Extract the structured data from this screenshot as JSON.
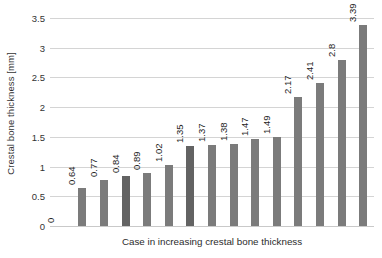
{
  "chart_data": {
    "type": "bar",
    "title": "",
    "xlabel": "Case in increasing crestal bone thickness",
    "ylabel": "Crestal bone thickness [mm]",
    "categories": [
      "1",
      "2",
      "3",
      "4",
      "5",
      "6",
      "7",
      "8",
      "9",
      "10",
      "11",
      "12",
      "13",
      "14",
      "15"
    ],
    "values": [
      0,
      0.64,
      0.77,
      0.84,
      0.89,
      1.02,
      1.35,
      1.37,
      1.38,
      1.47,
      1.49,
      2.17,
      2.41,
      2.8,
      3.39
    ],
    "data_labels": [
      "0",
      "0.64",
      "0.77",
      "0.84",
      "0.89",
      "1.02",
      "1.35",
      "1.37",
      "1.38",
      "1.47",
      "1.49",
      "2.17",
      "2.41",
      "2.8",
      "3.39"
    ],
    "ylim": [
      0,
      3.5
    ],
    "yticks": [
      0,
      0.5,
      1,
      1.5,
      2,
      2.5,
      3,
      3.5
    ],
    "ytick_labels": [
      "0",
      "0.5",
      "1",
      "1.5",
      "2",
      "2.5",
      "3",
      "3.5"
    ],
    "grid": true,
    "legend": false,
    "legend_position": "none",
    "bar_color": "#7b7b7b",
    "bar_color_alt": "#636363",
    "gridline_color": "#d4d4d4",
    "background": "#ffffff",
    "xtick_labels_visible": false,
    "series": [
      {
        "name": "Crestal bone thickness",
        "values": [
          0,
          0.64,
          0.77,
          0.84,
          0.89,
          1.02,
          1.35,
          1.37,
          1.38,
          1.47,
          1.49,
          2.17,
          2.41,
          2.8,
          3.39
        ]
      }
    ]
  }
}
